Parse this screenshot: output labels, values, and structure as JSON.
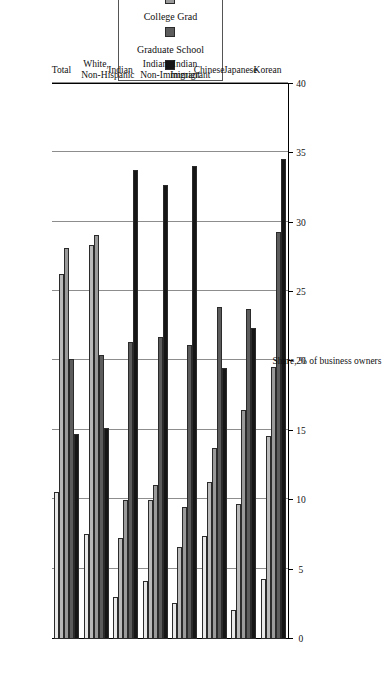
{
  "chart_data": {
    "type": "bar",
    "orientation": "horizontal",
    "title": "",
    "xlabel": "",
    "ylabel": "Share, % of business owners",
    "ylim": [
      0,
      40
    ],
    "ytick_labels": [
      "0",
      "5",
      "10",
      "15",
      "20",
      "25",
      "30",
      "35",
      "40"
    ],
    "ytick_values": [
      0,
      5,
      10,
      15,
      20,
      25,
      30,
      35,
      40
    ],
    "grid": true,
    "legend_position": "top",
    "categories": [
      "Total",
      "White, Non-Hispanic",
      "Indian",
      "Indian Non-Immigrant",
      "Indian Immigrant",
      "Chinese",
      "Japanese",
      "Korean"
    ],
    "series": [
      {
        "name": "HS Dropout",
        "color": "#e8e8e8",
        "values": [
          10.6,
          7.6,
          3.0,
          4.2,
          2.6,
          7.4,
          2.1,
          4.3
        ]
      },
      {
        "name": "HS Graduate",
        "color": "#b9b9b9",
        "values": [
          26.3,
          28.4,
          7.3,
          10.0,
          6.6,
          11.3,
          9.7,
          14.6
        ]
      },
      {
        "name": "Some College",
        "color": "#9a9a9a",
        "values": [
          28.2,
          29.1,
          10.0,
          11.1,
          9.5,
          13.8,
          16.5,
          19.6
        ]
      },
      {
        "name": "College Grad",
        "color": "#5c5c5c",
        "values": [
          20.2,
          20.5,
          21.4,
          21.8,
          21.2,
          23.9,
          23.8,
          29.3
        ]
      },
      {
        "name": "Graduate School",
        "color": "#161616",
        "values": [
          14.8,
          15.2,
          33.8,
          32.7,
          34.1,
          19.5,
          22.4,
          34.6
        ]
      }
    ]
  },
  "legend": {
    "items": [
      "HS Dropout",
      "HS Graduate",
      "Some College",
      "College Grad",
      "Graduate School"
    ]
  }
}
